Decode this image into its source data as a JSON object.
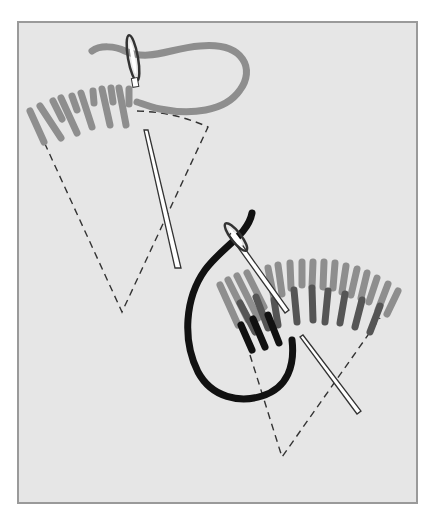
{
  "illustration": {
    "subject": "Long and short stitch embroidery technique",
    "frame": {
      "background": "#e6e6e6",
      "border": "#9a9a9a"
    },
    "colors": {
      "light_thread": "#8e8e8e",
      "medium_thread": "#555555",
      "dark_thread": "#111111",
      "guide_line": "#333333",
      "needle": "#ffffff"
    },
    "stage_1": {
      "label": "first row of stitches, light thread"
    },
    "stage_2": {
      "label": "second row of stitches, shaded threads"
    }
  }
}
